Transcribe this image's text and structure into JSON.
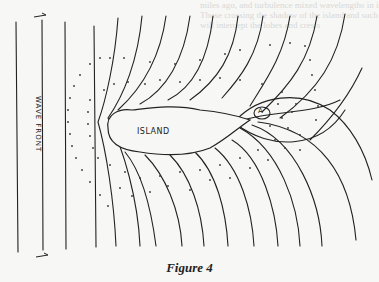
{
  "figure": {
    "caption": "Figure 4",
    "labels": {
      "wave_front": "WAVE FRONT",
      "island": "ISLAND",
      "point": "A"
    },
    "bleed_through_text": [
      "miles ago, and turbulence mixed wavelengths in interference",
      "Those crossing the shadow of the island and such crossing",
      "will intercept the lobes and crests"
    ],
    "colors": {
      "ink": "#222222",
      "paper": "#f7f7f5",
      "bleed": "#d8d8d6"
    }
  }
}
